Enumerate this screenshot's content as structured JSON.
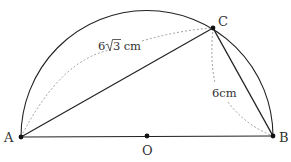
{
  "figure": {
    "type": "semicircle with inscribed triangle",
    "points": {
      "A": {
        "label": "A",
        "x": 21,
        "y": 137
      },
      "B": {
        "label": "B",
        "x": 273,
        "y": 136
      },
      "O": {
        "label": "O",
        "x": 147,
        "y": 136
      },
      "C": {
        "label": "C",
        "x": 213,
        "y": 28
      }
    },
    "radius": 126,
    "measurements": {
      "AC": {
        "coef": "6",
        "radicand": "3",
        "unit": " cm"
      },
      "BC": {
        "text": "6cm"
      }
    },
    "colors": {
      "stroke": "#222222",
      "dashed": "#888888",
      "text": "#333333"
    }
  }
}
